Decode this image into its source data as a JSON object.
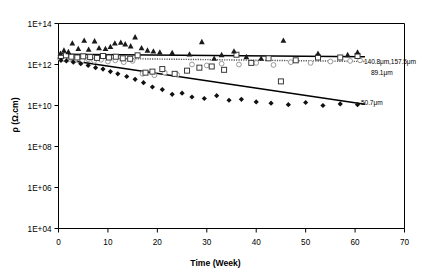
{
  "chart_data": {
    "type": "scatter",
    "title": "",
    "xlabel": "Time (Week)",
    "ylabel": "ρ (Ω.cm)",
    "xlim": [
      0,
      70
    ],
    "ylim": [
      10000.0,
      100000000000000.0
    ],
    "yscale": "log",
    "xticks": [
      0,
      10,
      20,
      30,
      40,
      50,
      60,
      70
    ],
    "xticklabels": [
      "0",
      "10",
      "20",
      "30",
      "40",
      "50",
      "60",
      "70"
    ],
    "yticks": [
      10000.0,
      1000000.0,
      100000000.0,
      10000000000.0,
      1000000000000.0,
      100000000000000.0
    ],
    "yticklabels": [
      "1E+04",
      "1E+06",
      "1E+08",
      "1E+10",
      "1E+12",
      "1E+14"
    ],
    "grid": false,
    "legend_position": "right-inline-annotations",
    "annotations": [
      {
        "text": "140.8μm,157.5μm",
        "x": 62.5,
        "y": 6500000000000.0
      },
      {
        "text": "89.1μm",
        "x": 63.5,
        "y": 2600000000000.0
      },
      {
        "text": "50.7μm",
        "x": 62.0,
        "y": 110000000000.0
      }
    ],
    "series": [
      {
        "name": "157.5μm",
        "marker": "triangle-filled",
        "color": "#1a1a1a",
        "points": [
          [
            0.4,
            3500000000000.0
          ],
          [
            1.1,
            5000000000000.0
          ],
          [
            2.0,
            4200000000000.0
          ],
          [
            2.8,
            11000000000000.0
          ],
          [
            4.0,
            6000000000000.0
          ],
          [
            5.2,
            15000000000000.0
          ],
          [
            6.1,
            5500000000000.0
          ],
          [
            7.3,
            14000000000000.0
          ],
          [
            8.2,
            6500000000000.0
          ],
          [
            9.5,
            6000000000000.0
          ],
          [
            10.5,
            7500000000000.0
          ],
          [
            11.4,
            11000000000000.0
          ],
          [
            12.6,
            12000000000000.0
          ],
          [
            13.5,
            10000000000000.0
          ],
          [
            14.6,
            8000000000000.0
          ],
          [
            15.5,
            22000000000000.0
          ],
          [
            16.8,
            6500000000000.0
          ],
          [
            18.0,
            5000000000000.0
          ],
          [
            19.2,
            4500000000000.0
          ],
          [
            20.5,
            4000000000000.0
          ],
          [
            23.0,
            3800000000000.0
          ],
          [
            26.5,
            3200000000000.0
          ],
          [
            29.0,
            13000000000000.0
          ],
          [
            31.5,
            2000000000000.0
          ],
          [
            33.0,
            3000000000000.0
          ],
          [
            35.5,
            4500000000000.0
          ],
          [
            38.0,
            2400000000000.0
          ],
          [
            41.0,
            2000000000000.0
          ],
          [
            45.5,
            15000000000000.0
          ],
          [
            52.5,
            3500000000000.0
          ],
          [
            58.5,
            3000000000000.0
          ],
          [
            60.5,
            4000000000000.0
          ]
        ]
      },
      {
        "name": "140.8μm",
        "marker": "square-open",
        "color": "#3a3a3a",
        "points": [
          [
            0.5,
            2600000000000.0
          ],
          [
            1.5,
            2800000000000.0
          ],
          [
            2.6,
            2400000000000.0
          ],
          [
            3.8,
            2200000000000.0
          ],
          [
            5.0,
            2500000000000.0
          ],
          [
            6.4,
            2300000000000.0
          ],
          [
            7.8,
            2100000000000.0
          ],
          [
            9.0,
            2600000000000.0
          ],
          [
            10.2,
            2200000000000.0
          ],
          [
            11.6,
            2400000000000.0
          ],
          [
            13.0,
            2000000000000.0
          ],
          [
            14.5,
            1900000000000.0
          ],
          [
            16.0,
            2800000000000.0
          ],
          [
            17.6,
            400000000000.0
          ],
          [
            19.0,
            450000000000.0
          ],
          [
            21.0,
            600000000000.0
          ],
          [
            23.5,
            350000000000.0
          ],
          [
            26.0,
            500000000000.0
          ],
          [
            28.5,
            700000000000.0
          ],
          [
            31.0,
            800000000000.0
          ],
          [
            33.5,
            550000000000.0
          ],
          [
            36.0,
            3000000000000.0
          ],
          [
            39.0,
            1200000000000.0
          ],
          [
            42.5,
            2000000000000.0
          ],
          [
            45.0,
            150000000000.0
          ],
          [
            48.0,
            1600000000000.0
          ],
          [
            52.5,
            2200000000000.0
          ],
          [
            57.0,
            2200000000000.0
          ],
          [
            60.5,
            2600000000000.0
          ]
        ]
      },
      {
        "name": "89.1μm",
        "marker": "circle-open",
        "color": "#9a9a9a",
        "points": [
          [
            0.3,
            2000000000000.0
          ],
          [
            1.2,
            1800000000000.0
          ],
          [
            2.3,
            1900000000000.0
          ],
          [
            3.4,
            1700000000000.0
          ],
          [
            4.8,
            1600000000000.0
          ],
          [
            6.0,
            1800000000000.0
          ],
          [
            7.2,
            1500000000000.0
          ],
          [
            8.6,
            1700000000000.0
          ],
          [
            10.0,
            1400000000000.0
          ],
          [
            11.5,
            1600000000000.0
          ],
          [
            13.2,
            1300000000000.0
          ],
          [
            15.0,
            1500000000000.0
          ],
          [
            17.0,
            350000000000.0
          ],
          [
            19.4,
            300000000000.0
          ],
          [
            21.5,
            400000000000.0
          ],
          [
            24.0,
            320000000000.0
          ],
          [
            27.0,
            1000000000000.0
          ],
          [
            30.0,
            900000000000.0
          ],
          [
            33.0,
            1100000000000.0
          ],
          [
            36.5,
            1000000000000.0
          ],
          [
            40.0,
            1200000000000.0
          ],
          [
            43.5,
            950000000000.0
          ],
          [
            47.0,
            1300000000000.0
          ],
          [
            51.0,
            1200000000000.0
          ],
          [
            55.0,
            1400000000000.0
          ],
          [
            59.0,
            1500000000000.0
          ],
          [
            61.0,
            1600000000000.0
          ]
        ]
      },
      {
        "name": "50.7μm",
        "marker": "diamond-filled",
        "color": "#111111",
        "points": [
          [
            0.5,
            1600000000000.0
          ],
          [
            1.6,
            1500000000000.0
          ],
          [
            3.0,
            1300000000000.0
          ],
          [
            4.5,
            1100000000000.0
          ],
          [
            6.0,
            900000000000.0
          ],
          [
            7.5,
            700000000000.0
          ],
          [
            9.0,
            600000000000.0
          ],
          [
            10.5,
            450000000000.0
          ],
          [
            12.0,
            350000000000.0
          ],
          [
            13.8,
            260000000000.0
          ],
          [
            15.5,
            190000000000.0
          ],
          [
            17.2,
            130000000000.0
          ],
          [
            19.0,
            80000000000.0
          ],
          [
            21.0,
            60000000000.0
          ],
          [
            23.0,
            35000000000.0
          ],
          [
            25.0,
            40000000000.0
          ],
          [
            27.0,
            26000000000.0
          ],
          [
            29.5,
            22000000000.0
          ],
          [
            32.0,
            30000000000.0
          ],
          [
            34.5,
            18000000000.0
          ],
          [
            37.0,
            20000000000.0
          ],
          [
            40.0,
            15000000000.0
          ],
          [
            43.0,
            13000000000.0
          ],
          [
            46.5,
            11000000000.0
          ],
          [
            50.0,
            14000000000.0
          ],
          [
            53.5,
            10000000000.0
          ],
          [
            57.0,
            12000000000.0
          ],
          [
            60.5,
            11000000000.0
          ]
        ]
      }
    ],
    "trendlines": [
      {
        "name": "trend-140.8-157.5",
        "style": "solid",
        "color": "#000000",
        "x0": 0.0,
        "y0": 3200000000000.0,
        "x1": 62.0,
        "y1": 2400000000000.0
      },
      {
        "name": "trend-89.1",
        "style": "dotted",
        "color": "#555555",
        "x0": 0.0,
        "y0": 2100000000000.0,
        "x1": 62.0,
        "y1": 1400000000000.0
      },
      {
        "name": "trend-50.7",
        "style": "solid",
        "color": "#000000",
        "x0": 0.0,
        "y0": 1900000000000.0,
        "x1": 62.0,
        "y1": 11500000000.0
      }
    ]
  }
}
